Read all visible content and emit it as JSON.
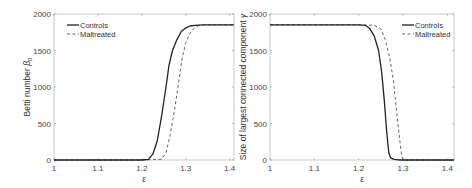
{
  "chart_data": [
    {
      "type": "line",
      "title": "",
      "xlabel": "ε",
      "ylabel": "Betti number β0",
      "xlim": [
        1,
        1.41
      ],
      "ylim": [
        0,
        2000
      ],
      "xticks": [
        "1",
        "1.1",
        "1.2",
        "1.3",
        "1.4"
      ],
      "yticks": [
        "0",
        "500",
        "1000",
        "1500",
        "2000"
      ],
      "grid": false,
      "legend_position": "upper left",
      "series": [
        {
          "name": "Controls",
          "style": "solid",
          "x": [
            1.0,
            1.1,
            1.2,
            1.215,
            1.225,
            1.235,
            1.245,
            1.255,
            1.262,
            1.27,
            1.28,
            1.29,
            1.3,
            1.31,
            1.32,
            1.34,
            1.41
          ],
          "y": [
            0,
            0,
            0,
            10,
            80,
            260,
            600,
            1000,
            1300,
            1500,
            1650,
            1760,
            1810,
            1835,
            1845,
            1850,
            1850
          ]
        },
        {
          "name": "Maltreated",
          "style": "dashed",
          "x": [
            1.0,
            1.1,
            1.2,
            1.245,
            1.255,
            1.265,
            1.275,
            1.285,
            1.292,
            1.3,
            1.31,
            1.32,
            1.33,
            1.34,
            1.41
          ],
          "y": [
            0,
            0,
            0,
            10,
            100,
            350,
            700,
            1100,
            1400,
            1600,
            1740,
            1810,
            1840,
            1850,
            1850
          ]
        }
      ]
    },
    {
      "type": "line",
      "title": "",
      "xlabel": "ε",
      "ylabel": "Size of largest connected component γ",
      "xlim": [
        1,
        1.415
      ],
      "ylim": [
        0,
        2000
      ],
      "xticks": [
        "1",
        "1.1",
        "1.2",
        "1.3",
        "1.4"
      ],
      "yticks": [
        "0",
        "500",
        "1000",
        "1500",
        "2000"
      ],
      "grid": false,
      "legend_position": "upper right",
      "series": [
        {
          "name": "Controls",
          "style": "solid",
          "x": [
            1.0,
            1.1,
            1.2,
            1.215,
            1.225,
            1.235,
            1.245,
            1.252,
            1.258,
            1.263,
            1.268,
            1.272,
            1.28,
            1.29,
            1.3,
            1.415
          ],
          "y": [
            1850,
            1850,
            1850,
            1845,
            1800,
            1700,
            1500,
            1200,
            800,
            400,
            100,
            30,
            10,
            3,
            0,
            0
          ]
        },
        {
          "name": "Maltreated",
          "style": "dashed",
          "x": [
            1.0,
            1.1,
            1.2,
            1.235,
            1.25,
            1.26,
            1.27,
            1.278,
            1.285,
            1.292,
            1.297,
            1.3,
            1.415
          ],
          "y": [
            1850,
            1850,
            1850,
            1845,
            1800,
            1650,
            1400,
            1100,
            700,
            300,
            60,
            0,
            0
          ]
        }
      ]
    }
  ],
  "legend": {
    "controls": "Controls",
    "maltreated": "Maltreated"
  },
  "left": {
    "ylabel": "Betti number ",
    "ylabel_sym": "β",
    "ylabel_sub": "0",
    "xlabel": "ε"
  },
  "right": {
    "ylabel": "Size of largest connected component ",
    "ylabel_sym": "γ",
    "xlabel": "ε"
  },
  "ticks": {
    "x": [
      "1",
      "1.1",
      "1.2",
      "1.3",
      "1.4"
    ],
    "y": [
      "0",
      "500",
      "1000",
      "1500",
      "2000"
    ]
  }
}
